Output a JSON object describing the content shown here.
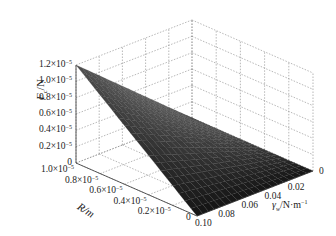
{
  "chart_data": {
    "type": "surface3d",
    "title": "",
    "zlabel": "F_c/N",
    "ylabel": "R/m",
    "xlabel": "γ_w/N·m⁻¹",
    "z_ticks": [
      "0",
      "0.2×10⁻⁵",
      "0.4×10⁻⁵",
      "0.6×10⁻⁵",
      "0.8×10⁻⁵",
      "1.0×10⁻⁵",
      "1.2×10⁻⁵"
    ],
    "z_tick_values": [
      0,
      2e-06,
      4e-06,
      6e-06,
      8e-06,
      1e-05,
      1.2e-05
    ],
    "r_ticks": [
      "0",
      "0.2×10⁻⁵",
      "0.4×10⁻⁵",
      "0.6×10⁻⁵",
      "0.8×10⁻⁵",
      "1.0×10⁻⁵"
    ],
    "r_tick_values": [
      0,
      2e-06,
      4e-06,
      6e-06,
      8e-06,
      1e-05
    ],
    "gamma_ticks": [
      "0",
      "0.02",
      "0.04",
      "0.06",
      "0.08",
      "0.10"
    ],
    "gamma_tick_values": [
      0,
      0.02,
      0.04,
      0.06,
      0.08,
      0.1
    ],
    "zlim": [
      0,
      1.2e-05
    ],
    "ylim": [
      0,
      1e-05
    ],
    "xlim": [
      0,
      0.1
    ],
    "grid": true,
    "colormap": "gray",
    "surface_model": "F = k·R·γ, zero along R=0 and γ=0 edges, maximum ≈1.2×10⁻⁵ N at R=1.0×10⁻⁵ m, γ=0.10 N·m⁻¹",
    "corner_values": [
      {
        "R": 0,
        "gamma": 0,
        "F": 0
      },
      {
        "R": 1e-05,
        "gamma": 0,
        "F": 0
      },
      {
        "R": 0,
        "gamma": 0.1,
        "F": 0
      },
      {
        "R": 1e-05,
        "gamma": 0.1,
        "F": 1.2e-05
      }
    ],
    "mesh": {
      "r_steps": 20,
      "gamma_steps": 20
    }
  },
  "labels": {
    "z_title": "F",
    "z_title_sub": "c",
    "z_title_unit": "/N",
    "r_title": "R/m",
    "g_title": "γ",
    "g_title_sub": "w",
    "g_title_unit": "/N·m",
    "g_title_sup": "−1"
  }
}
